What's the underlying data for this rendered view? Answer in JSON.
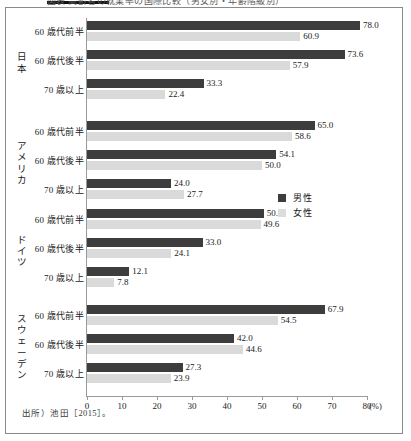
{
  "figure": {
    "truncated_caption": "図表 高齢者の就業率の国際比較（男女別・年齢階級別）",
    "source_note": "出所）池田［2015］。"
  },
  "legend": {
    "position": "middle-right",
    "items": [
      {
        "key": "male",
        "label": "男性",
        "color": "#3d3d3d"
      },
      {
        "key": "female",
        "label": "女性",
        "color": "#dcdcdc"
      }
    ]
  },
  "axis": {
    "x_ticks": [
      "0",
      "10",
      "20",
      "30",
      "40",
      "50",
      "60",
      "70",
      "80"
    ],
    "x_unit": "(%)",
    "x_min": 0,
    "x_max": 80
  },
  "chart_data": {
    "type": "bar",
    "orientation": "horizontal",
    "title": "",
    "xlabel": "(%)",
    "ylabel": "",
    "xlim": [
      0,
      80
    ],
    "grid": false,
    "legend_position": "middle-right",
    "group_field": "country",
    "categories": [
      "60 歳代前半",
      "60 歳代後半",
      "70 歳以上"
    ],
    "series": [
      {
        "name": "男性",
        "color": "#3d3d3d"
      },
      {
        "name": "女性",
        "color": "#dcdcdc"
      }
    ],
    "groups": [
      {
        "country": "日本",
        "country_chars": [
          "日",
          "本"
        ],
        "rows": [
          {
            "category": "60 歳代前半",
            "male": 78.0,
            "female": 60.9,
            "male_label": "78.0",
            "female_label": "60.9"
          },
          {
            "category": "60 歳代後半",
            "male": 73.6,
            "female": 57.9,
            "male_label": "73.6",
            "female_label": "57.9"
          },
          {
            "category": "70 歳以上",
            "male": 33.3,
            "female": 22.4,
            "male_label": "33.3",
            "female_label": "22.4"
          }
        ]
      },
      {
        "country": "アメリカ",
        "country_chars": [
          "ア",
          "メ",
          "リ",
          "カ"
        ],
        "rows": [
          {
            "category": "60 歳代前半",
            "male": 65.0,
            "female": 58.6,
            "male_label": "65.0",
            "female_label": "58.6"
          },
          {
            "category": "60 歳代後半",
            "male": 54.1,
            "female": 50.0,
            "male_label": "54.1",
            "female_label": "50.0"
          },
          {
            "category": "70 歳以上",
            "male": 24.0,
            "female": 27.7,
            "male_label": "24.0",
            "female_label": "27.7"
          }
        ]
      },
      {
        "country": "ドイツ",
        "country_chars": [
          "ド",
          "イ",
          "ツ"
        ],
        "rows": [
          {
            "category": "60 歳代前半",
            "male": 50.5,
            "female": 49.6,
            "male_label": "50.5",
            "female_label": "49.6"
          },
          {
            "category": "60 歳代後半",
            "male": 33.0,
            "female": 24.1,
            "male_label": "33.0",
            "female_label": "24.1"
          },
          {
            "category": "70 歳以上",
            "male": 12.1,
            "female": 7.8,
            "male_label": "12.1",
            "female_label": "7.8"
          }
        ]
      },
      {
        "country": "スウェーデン",
        "country_chars": [
          "ス",
          "ウ",
          "ェ",
          "ー",
          "デ",
          "ン"
        ],
        "rows": [
          {
            "category": "60 歳代前半",
            "male": 67.9,
            "female": 54.5,
            "male_label": "67.9",
            "female_label": "54.5"
          },
          {
            "category": "60 歳代後半",
            "male": 42.0,
            "female": 44.6,
            "male_label": "42.0",
            "female_label": "44.6"
          },
          {
            "category": "70 歳以上",
            "male": 27.3,
            "female": 23.9,
            "male_label": "27.3",
            "female_label": "23.9"
          }
        ]
      }
    ]
  }
}
